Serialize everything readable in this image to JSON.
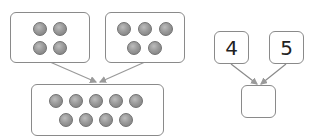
{
  "left_diagram": {
    "group_a_count": 4,
    "group_b_count": 5,
    "total_count": 9
  },
  "right_diagram": {
    "left_value": "4",
    "right_value": "5",
    "result_value": ""
  },
  "colors": {
    "border": "#8a8a8a",
    "dot": "#9a9a9a",
    "arrow": "#9a9a9a"
  }
}
